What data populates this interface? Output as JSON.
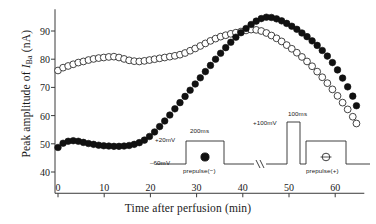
{
  "chart_data": {
    "type": "scatter",
    "title": "",
    "xlabel": "Time after perfusion (min)",
    "ylabel": "Peak amplitude of I_Ba (nA)",
    "ylabel_parts": {
      "prefix": "Peak amplitude of ",
      "italic": "I",
      "subscript": "Ba",
      "suffix": " (nA)"
    },
    "xlim": [
      0,
      65
    ],
    "ylim": [
      36,
      97
    ],
    "xticks": [
      0,
      10,
      20,
      30,
      40,
      50,
      60
    ],
    "yticks": [
      40,
      50,
      60,
      70,
      80,
      90
    ],
    "grid": false,
    "legend": "none",
    "series": [
      {
        "name": "prepulse(+)",
        "marker": "open-circle",
        "color": "#ffffff",
        "edge_color": "#222222",
        "x": [
          0,
          1.1,
          2.2,
          3.3,
          4.4,
          5.5,
          6.6,
          7.7,
          8.8,
          9.9,
          11.0,
          12.1,
          13.2,
          14.3,
          15.4,
          16.5,
          17.6,
          18.7,
          19.8,
          20.9,
          22.0,
          23.1,
          24.2,
          25.3,
          26.4,
          27.5,
          28.6,
          29.7,
          30.8,
          31.9,
          33.0,
          34.1,
          35.2,
          36.3,
          37.4,
          38.5,
          39.6,
          40.7,
          41.8,
          42.9,
          44.0,
          45.1,
          46.2,
          47.3,
          48.4,
          49.5,
          50.6,
          51.7,
          52.8,
          53.9,
          55.0,
          56.1,
          57.2,
          58.3,
          59.4,
          60.5,
          61.6,
          62.7,
          63.8,
          64.6
        ],
        "y": [
          76.0,
          77.0,
          77.6,
          78.2,
          78.8,
          79.2,
          79.7,
          80.1,
          80.4,
          80.6,
          80.8,
          80.9,
          80.6,
          80.1,
          79.6,
          79.3,
          79.2,
          79.4,
          79.7,
          80.0,
          80.3,
          80.6,
          80.9,
          81.2,
          81.6,
          82.2,
          83.0,
          83.8,
          84.7,
          85.6,
          86.5,
          87.3,
          88.0,
          88.5,
          89.0,
          89.4,
          89.8,
          90.2,
          90.5,
          90.4,
          90.0,
          89.3,
          88.4,
          87.4,
          86.3,
          85.0,
          83.7,
          82.3,
          80.8,
          79.2,
          77.5,
          75.6,
          73.6,
          71.5,
          69.3,
          67.0,
          64.6,
          62.2,
          59.6,
          57.2
        ]
      },
      {
        "name": "prepulse(-)",
        "marker": "filled-circle",
        "color": "#111111",
        "edge_color": "#111111",
        "x": [
          0,
          1.1,
          2.2,
          3.3,
          4.4,
          5.5,
          6.6,
          7.7,
          8.8,
          9.9,
          11.0,
          12.1,
          13.2,
          14.3,
          15.4,
          16.5,
          17.6,
          18.7,
          19.8,
          20.9,
          22.0,
          23.1,
          24.2,
          25.3,
          26.4,
          27.5,
          28.6,
          29.7,
          30.8,
          31.9,
          33.0,
          34.1,
          35.2,
          36.3,
          37.4,
          38.5,
          39.6,
          40.7,
          41.8,
          42.9,
          44.0,
          45.1,
          46.2,
          47.3,
          48.4,
          49.5,
          50.6,
          51.7,
          52.8,
          53.9,
          55.0,
          56.1,
          57.2,
          58.3,
          59.4,
          60.5,
          61.6,
          62.7,
          63.8,
          64.6
        ],
        "y": [
          48.7,
          50.2,
          50.9,
          51.1,
          50.9,
          50.5,
          50.1,
          49.8,
          49.5,
          49.3,
          49.2,
          49.1,
          49.1,
          49.2,
          49.4,
          49.8,
          50.4,
          51.3,
          52.6,
          54.2,
          56.1,
          58.1,
          60.2,
          62.4,
          64.6,
          66.8,
          69.0,
          71.2,
          73.4,
          75.6,
          77.8,
          80.0,
          82.1,
          84.1,
          86.0,
          87.8,
          89.4,
          90.9,
          92.3,
          93.5,
          94.4,
          94.9,
          94.8,
          94.3,
          93.6,
          92.7,
          91.7,
          90.6,
          89.3,
          88.0,
          86.5,
          84.9,
          83.1,
          81.1,
          78.8,
          76.2,
          73.3,
          70.2,
          66.9,
          63.5
        ]
      }
    ]
  },
  "inset": {
    "holding_label": "–60mV",
    "prepulse_amp_label": "+20mV",
    "prepulse_dur_label": "200ms",
    "prepulse_neg_label": "prepulse(−)",
    "test_amp_label": "+100mV",
    "test_dur_label": "100ms",
    "prepulse_pos_label": "prepulse(+)",
    "break_symbol": "≈"
  }
}
